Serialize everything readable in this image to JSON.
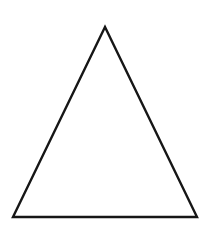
{
  "canvas": {
    "width": 208,
    "height": 235,
    "background_color": "#ffffff",
    "title": "Triangle"
  },
  "figure": {
    "name": "triangle",
    "shape_type": "triangle",
    "classification": "isosceles",
    "fill": "none",
    "fill_color": "#ffffff",
    "stroke_color": "#161616",
    "stroke_width": 2.4,
    "closed": true,
    "vertex_count": 3,
    "vertices": [
      {
        "label": "apex",
        "x": 105,
        "y": 27
      },
      {
        "label": "bottom-left",
        "x": 13,
        "y": 217
      },
      {
        "label": "bottom-right",
        "x": 197,
        "y": 217
      }
    ],
    "points_attr": "105,27 13,217 197,217",
    "edges": [
      {
        "name": "left-edge",
        "from": "apex",
        "to": "bottom-left"
      },
      {
        "name": "right-edge",
        "from": "apex",
        "to": "bottom-right"
      },
      {
        "name": "base-edge",
        "from": "bottom-left",
        "to": "bottom-right"
      }
    ],
    "base_width": 184,
    "height": 190
  }
}
